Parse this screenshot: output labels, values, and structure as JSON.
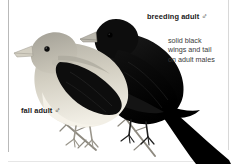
{
  "plate": {
    "kind": "field-guide-bird-plate",
    "background_color": "#ffffff",
    "rule_color": "#b9b9b9",
    "width": 231,
    "height": 164
  },
  "labels": {
    "breeding_adult": "breeding adult",
    "fall_adult": "fall adult",
    "male_symbol": "♂"
  },
  "note": {
    "line1": "solid black",
    "line2": "wings and tail",
    "line3": "on adult males"
  },
  "birds": {
    "fall_adult": {
      "name": "fall-adult-male-bird",
      "body_color": "#d6d2c4",
      "belly_color": "#efece2",
      "head_color": "#a9a79c",
      "wing_color": "#121212",
      "bill_color": "#cfcabb",
      "eye_color": "#101010",
      "leg_color": "#9a968c"
    },
    "breeding_adult": {
      "name": "breeding-adult-male-bird",
      "body_color": "#0b0b0b",
      "wing_color": "#000000",
      "bill_color": "#b9b6ac",
      "eye_color": "#000000",
      "leg_color": "#2a2a2a"
    }
  },
  "perches": {
    "color": "#8e8a80",
    "count": 2
  }
}
